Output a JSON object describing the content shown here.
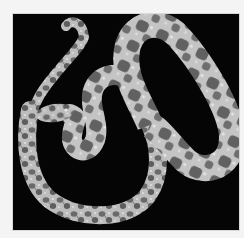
{
  "image": {
    "subject": "snake",
    "description": "Grayscale photograph of a spotted snake coiled in a loop shape on a black background",
    "background_color": "#050505",
    "border_color": "#f4f4f4",
    "body_light_color": "#c9c9c9",
    "body_mid_color": "#9a9a9a",
    "blotch_color": "#5a5a5a"
  }
}
